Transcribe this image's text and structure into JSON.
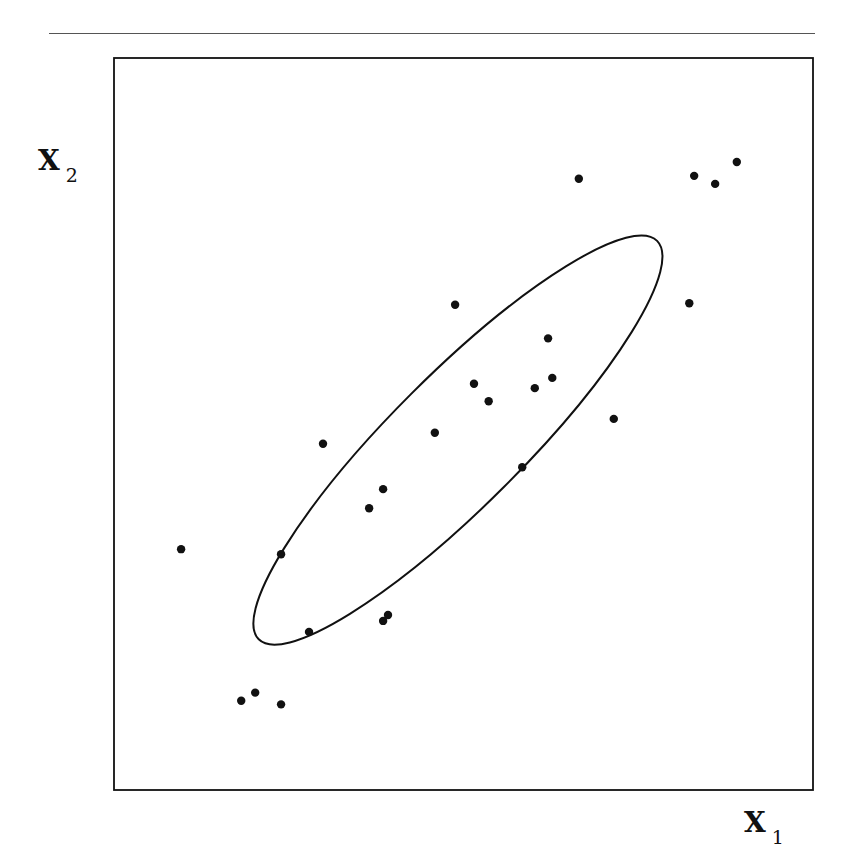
{
  "page": {
    "header_fragment": "",
    "has_top_rule": true
  },
  "chart_data": {
    "type": "scatter",
    "title": "",
    "xlabel": "X",
    "xlabel_subscript": "1",
    "ylabel": "X",
    "ylabel_subscript": "2",
    "xlim": [
      0,
      100
    ],
    "ylim": [
      0,
      100
    ],
    "grid": false,
    "ticks": false,
    "legend": null,
    "point_color": "#111111",
    "line_color": "#111111",
    "series": [
      {
        "name": "observations",
        "points": [
          {
            "x": 66.5,
            "y": 83.5
          },
          {
            "x": 83.0,
            "y": 83.9
          },
          {
            "x": 86.0,
            "y": 82.8
          },
          {
            "x": 89.1,
            "y": 85.8
          },
          {
            "x": 48.8,
            "y": 66.3
          },
          {
            "x": 82.3,
            "y": 66.5
          },
          {
            "x": 62.1,
            "y": 61.7
          },
          {
            "x": 51.5,
            "y": 55.5
          },
          {
            "x": 62.7,
            "y": 56.3
          },
          {
            "x": 60.2,
            "y": 54.9
          },
          {
            "x": 53.6,
            "y": 53.1
          },
          {
            "x": 71.5,
            "y": 50.7
          },
          {
            "x": 45.9,
            "y": 48.8
          },
          {
            "x": 29.9,
            "y": 47.3
          },
          {
            "x": 58.4,
            "y": 44.1
          },
          {
            "x": 38.5,
            "y": 41.1
          },
          {
            "x": 36.5,
            "y": 38.5
          },
          {
            "x": 9.6,
            "y": 32.9
          },
          {
            "x": 23.9,
            "y": 32.2
          },
          {
            "x": 39.2,
            "y": 23.9
          },
          {
            "x": 38.5,
            "y": 23.1
          },
          {
            "x": 27.9,
            "y": 21.6
          },
          {
            "x": 20.2,
            "y": 13.3
          },
          {
            "x": 18.2,
            "y": 12.2
          },
          {
            "x": 23.9,
            "y": 11.7
          }
        ]
      }
    ],
    "annotations": [
      {
        "type": "ellipse",
        "name": "confidence-ellipse",
        "center": {
          "x": 49.2,
          "y": 47.8
        },
        "semi_major": 40.3,
        "semi_minor": 9.4,
        "rotation_deg": 45
      }
    ]
  }
}
